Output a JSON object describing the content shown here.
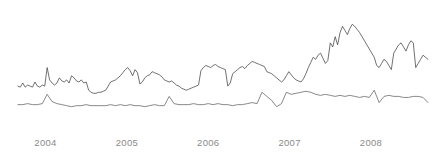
{
  "chart_data": {
    "type": "line",
    "title": "",
    "subtitle": "",
    "xlabel": "",
    "ylabel": "",
    "grid": false,
    "legend_position": "none",
    "axis_visible": false,
    "background_color": "#ffffff",
    "xlim": [
      2003.6,
      2008.75
    ],
    "ylim": [
      0,
      100
    ],
    "xticks": [
      2004,
      2005,
      2006,
      2007,
      2008
    ],
    "xtick_labels": [
      "2004",
      "2005",
      "2006",
      "2007",
      "2008"
    ],
    "ytick_labels": [],
    "series": [
      {
        "name": "upper-series",
        "color": "#4d4d4d",
        "line_width": 0.8,
        "x": [
          2003.66,
          2003.69,
          2003.72,
          2003.75,
          2003.78,
          2003.81,
          2003.84,
          2003.87,
          2003.9,
          2003.93,
          2003.96,
          2003.99,
          2004.02,
          2004.05,
          2004.08,
          2004.11,
          2004.14,
          2004.17,
          2004.2,
          2004.23,
          2004.26,
          2004.29,
          2004.32,
          2004.35,
          2004.38,
          2004.41,
          2004.44,
          2004.47,
          2004.5,
          2004.53,
          2004.56,
          2004.59,
          2004.62,
          2004.65,
          2004.68,
          2004.71,
          2004.74,
          2004.77,
          2004.8,
          2004.83,
          2004.86,
          2004.89,
          2004.92,
          2004.95,
          2004.98,
          2005.01,
          2005.04,
          2005.07,
          2005.1,
          2005.13,
          2005.16,
          2005.19,
          2005.22,
          2005.25,
          2005.28,
          2005.31,
          2005.34,
          2005.37,
          2005.4,
          2005.43,
          2005.46,
          2005.49,
          2005.52,
          2005.55,
          2005.58,
          2005.61,
          2005.64,
          2005.67,
          2005.7,
          2005.73,
          2005.76,
          2005.79,
          2005.82,
          2005.85,
          2005.88,
          2005.91,
          2005.94,
          2005.97,
          2006.0,
          2006.03,
          2006.06,
          2006.09,
          2006.12,
          2006.15,
          2006.18,
          2006.21,
          2006.24,
          2006.27,
          2006.3,
          2006.33,
          2006.36,
          2006.39,
          2006.42,
          2006.45,
          2006.48,
          2006.51,
          2006.54,
          2006.57,
          2006.6,
          2006.63,
          2006.66,
          2006.69,
          2006.72,
          2006.75,
          2006.78,
          2006.81,
          2006.84,
          2006.87,
          2006.9,
          2006.93,
          2006.96,
          2006.99,
          2007.02,
          2007.05,
          2007.08,
          2007.11,
          2007.14,
          2007.17,
          2007.2,
          2007.23,
          2007.26,
          2007.29,
          2007.32,
          2007.35,
          2007.38,
          2007.41,
          2007.44,
          2007.47,
          2007.5,
          2007.53,
          2007.56,
          2007.59,
          2007.62,
          2007.65,
          2007.68,
          2007.71,
          2007.74,
          2007.77,
          2007.8,
          2007.83,
          2007.86,
          2007.89,
          2007.92,
          2007.95,
          2007.98,
          2008.01,
          2008.04,
          2008.07,
          2008.1,
          2008.13,
          2008.16,
          2008.19,
          2008.22,
          2008.25,
          2008.28,
          2008.31,
          2008.34,
          2008.37,
          2008.4,
          2008.43,
          2008.46,
          2008.49,
          2008.52,
          2008.55,
          2008.58,
          2008.61,
          2008.64,
          2008.67,
          2008.7
        ],
        "values": [
          30,
          29,
          33,
          29,
          31,
          30,
          29,
          34,
          30,
          29,
          31,
          30,
          48,
          36,
          33,
          31,
          33,
          38,
          35,
          34,
          36,
          33,
          40,
          38,
          35,
          34,
          36,
          33,
          34,
          26,
          24,
          23,
          23,
          24,
          24,
          25,
          26,
          30,
          34,
          35,
          36,
          38,
          40,
          43,
          46,
          48,
          45,
          40,
          46,
          43,
          32,
          34,
          38,
          40,
          41,
          44,
          43,
          42,
          41,
          39,
          36,
          35,
          34,
          35,
          33,
          31,
          30,
          28,
          27,
          26,
          27,
          28,
          29,
          30,
          31,
          45,
          48,
          50,
          49,
          48,
          50,
          51,
          49,
          48,
          47,
          46,
          30,
          33,
          42,
          44,
          46,
          48,
          49,
          47,
          50,
          52,
          54,
          53,
          52,
          51,
          50,
          49,
          44,
          43,
          42,
          40,
          38,
          36,
          34,
          36,
          40,
          44,
          41,
          38,
          36,
          35,
          34,
          37,
          42,
          48,
          53,
          58,
          56,
          60,
          62,
          57,
          52,
          55,
          72,
          68,
          78,
          70,
          82,
          88,
          84,
          80,
          86,
          90,
          88,
          85,
          82,
          78,
          74,
          70,
          66,
          62,
          58,
          50,
          48,
          52,
          56,
          54,
          50,
          46,
          62,
          66,
          70,
          72,
          68,
          64,
          70,
          74,
          72,
          48,
          52,
          56,
          60,
          58,
          56
        ]
      },
      {
        "name": "lower-series",
        "color": "#6b6b6b",
        "line_width": 0.8,
        "x": [
          2003.66,
          2003.72,
          2003.78,
          2003.84,
          2003.9,
          2003.96,
          2004.02,
          2004.08,
          2004.14,
          2004.2,
          2004.26,
          2004.32,
          2004.38,
          2004.44,
          2004.5,
          2004.56,
          2004.62,
          2004.68,
          2004.74,
          2004.8,
          2004.86,
          2004.92,
          2004.98,
          2005.04,
          2005.1,
          2005.16,
          2005.22,
          2005.28,
          2005.34,
          2005.4,
          2005.46,
          2005.52,
          2005.58,
          2005.64,
          2005.7,
          2005.76,
          2005.82,
          2005.88,
          2005.94,
          2006.0,
          2006.06,
          2006.12,
          2006.18,
          2006.24,
          2006.3,
          2006.36,
          2006.42,
          2006.48,
          2006.54,
          2006.6,
          2006.66,
          2006.72,
          2006.78,
          2006.84,
          2006.9,
          2006.96,
          2007.02,
          2007.08,
          2007.14,
          2007.2,
          2007.26,
          2007.32,
          2007.38,
          2007.44,
          2007.5,
          2007.56,
          2007.62,
          2007.68,
          2007.74,
          2007.8,
          2007.86,
          2007.92,
          2007.98,
          2008.04,
          2008.1,
          2008.16,
          2008.22,
          2008.28,
          2008.34,
          2008.4,
          2008.46,
          2008.52,
          2008.58,
          2008.64,
          2008.7
        ],
        "values": [
          12,
          12,
          13,
          12,
          12,
          13,
          22,
          15,
          13,
          12,
          11,
          10,
          11,
          11,
          12,
          11,
          11,
          11,
          11,
          12,
          11,
          12,
          11,
          12,
          11,
          11,
          10,
          11,
          12,
          11,
          11,
          20,
          13,
          12,
          12,
          12,
          13,
          12,
          12,
          13,
          12,
          13,
          12,
          12,
          11,
          12,
          12,
          13,
          14,
          13,
          24,
          20,
          16,
          10,
          13,
          24,
          22,
          23,
          24,
          25,
          24,
          22,
          21,
          22,
          21,
          20,
          21,
          20,
          21,
          20,
          19,
          20,
          19,
          26,
          14,
          20,
          21,
          20,
          20,
          19,
          19,
          20,
          20,
          19,
          14
        ]
      }
    ]
  }
}
